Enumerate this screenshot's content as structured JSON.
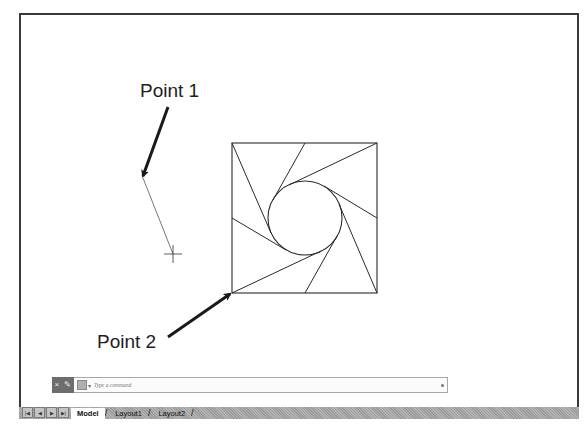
{
  "drawing": {
    "annotations": [
      {
        "id": "point1",
        "text": "Point 1",
        "x": 140,
        "y": 80
      },
      {
        "id": "point2",
        "text": "Point 2",
        "x": 97,
        "y": 331
      }
    ],
    "square": {
      "x1": 232,
      "y1": 143,
      "x2": 377,
      "y2": 293
    },
    "circle": {
      "cx": 305,
      "cy": 218,
      "r": 37
    },
    "tangent_lines": [
      {
        "from": [
          232,
          143
        ],
        "to": [
          271,
          233
        ]
      },
      {
        "from": [
          305,
          143
        ],
        "to": [
          273,
          200
        ]
      },
      {
        "from": [
          377,
          143
        ],
        "to": [
          289,
          185
        ]
      },
      {
        "from": [
          377,
          218
        ],
        "to": [
          324,
          186
        ]
      },
      {
        "from": [
          377,
          293
        ],
        "to": [
          339,
          204
        ]
      },
      {
        "from": [
          305,
          293
        ],
        "to": [
          337,
          236
        ]
      },
      {
        "from": [
          232,
          293
        ],
        "to": [
          321,
          251
        ]
      },
      {
        "from": [
          232,
          218
        ],
        "to": [
          286,
          250
        ]
      }
    ],
    "rubber_band": {
      "from": [
        143,
        178
      ],
      "to": [
        173,
        254
      ]
    },
    "crosshair": {
      "x": 173,
      "y": 254,
      "size": 9
    },
    "arrows": [
      {
        "id": "arrow-point1",
        "from": [
          168,
          107
        ],
        "to": [
          143,
          176
        ]
      },
      {
        "id": "arrow-point2",
        "from": [
          168,
          337
        ],
        "to": [
          230,
          294
        ]
      }
    ],
    "line_color": "#2a2a2a",
    "arrow_color": "#1a1a1a"
  },
  "command_line": {
    "close_icon": "×",
    "customize_icon": "wrench",
    "prompt_icon": "command-prompt",
    "placeholder": "Type a command"
  },
  "layout_tabs": {
    "nav_buttons": [
      "|◀",
      "◀",
      "▶",
      "▶|"
    ],
    "tabs": [
      {
        "label": "Model",
        "active": true
      },
      {
        "label": "Layout1",
        "active": false
      },
      {
        "label": "Layout2",
        "active": false
      }
    ]
  }
}
